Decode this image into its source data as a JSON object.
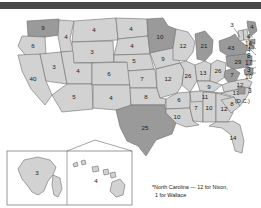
{
  "figure": {
    "footnote": "*North Carolina — 12 for Nixon, 1 for Wallace",
    "dc_label": "(D.C.)",
    "dc_votes": "3",
    "colors": {
      "light_state": "#d2d2d2",
      "dark_state": "#9a9a9a",
      "border": "#6d6d6d",
      "topbar": "#4a4a4a",
      "text": "#1a1a1a"
    }
  },
  "chart_data": {
    "type": "map",
    "units": "electoral votes",
    "legend": {
      "light": "light gray state",
      "dark": "dark gray state"
    },
    "annotations": [
      "*North Carolina — 12 for Nixon, 1 for Wallace",
      "(D.C.)"
    ],
    "states": [
      {
        "code": "WA",
        "label": "9",
        "shade": "dark"
      },
      {
        "code": "OR",
        "label": "6",
        "shade": "light"
      },
      {
        "code": "CA",
        "label": "40",
        "shade": "light"
      },
      {
        "code": "NV",
        "label": "3",
        "shade": "light"
      },
      {
        "code": "ID",
        "label": "4",
        "shade": "light"
      },
      {
        "code": "MT",
        "label": "4",
        "shade": "light"
      },
      {
        "code": "WY",
        "label": "3",
        "shade": "light"
      },
      {
        "code": "UT",
        "label": "4",
        "shade": "light"
      },
      {
        "code": "AZ",
        "label": "5",
        "shade": "light"
      },
      {
        "code": "CO",
        "label": "6",
        "shade": "light"
      },
      {
        "code": "NM",
        "label": "4",
        "shade": "light"
      },
      {
        "code": "ND",
        "label": "4",
        "shade": "light"
      },
      {
        "code": "SD",
        "label": "4",
        "shade": "light"
      },
      {
        "code": "NE",
        "label": "5",
        "shade": "light"
      },
      {
        "code": "KS",
        "label": "7",
        "shade": "light"
      },
      {
        "code": "OK",
        "label": "8",
        "shade": "light"
      },
      {
        "code": "TX",
        "label": "25",
        "shade": "dark"
      },
      {
        "code": "MN",
        "label": "10",
        "shade": "dark"
      },
      {
        "code": "IA",
        "label": "9",
        "shade": "light"
      },
      {
        "code": "MO",
        "label": "12",
        "shade": "light"
      },
      {
        "code": "AR",
        "label": "6",
        "shade": "light"
      },
      {
        "code": "LA",
        "label": "10",
        "shade": "light"
      },
      {
        "code": "WI",
        "label": "12",
        "shade": "light"
      },
      {
        "code": "IL",
        "label": "26",
        "shade": "light"
      },
      {
        "code": "MS",
        "label": "7",
        "shade": "light"
      },
      {
        "code": "MI",
        "label": "21",
        "shade": "dark"
      },
      {
        "code": "IN",
        "label": "13",
        "shade": "light"
      },
      {
        "code": "KY",
        "label": "9",
        "shade": "light"
      },
      {
        "code": "TN",
        "label": "11",
        "shade": "light"
      },
      {
        "code": "AL",
        "label": "10",
        "shade": "light"
      },
      {
        "code": "OH",
        "label": "26",
        "shade": "light"
      },
      {
        "code": "GA",
        "label": "12",
        "shade": "light"
      },
      {
        "code": "FL",
        "label": "14",
        "shade": "light"
      },
      {
        "code": "SC",
        "label": "8",
        "shade": "light"
      },
      {
        "code": "NC",
        "label": "13*",
        "shade": "light"
      },
      {
        "code": "VA",
        "label": "12",
        "shade": "light"
      },
      {
        "code": "WV",
        "label": "7",
        "shade": "dark"
      },
      {
        "code": "PA",
        "label": "29",
        "shade": "dark"
      },
      {
        "code": "NY",
        "label": "43",
        "shade": "dark"
      },
      {
        "code": "VT",
        "label": "3",
        "shade": "light"
      },
      {
        "code": "ME",
        "label": "4",
        "shade": "dark"
      },
      {
        "code": "AK",
        "label": "3",
        "shade": "light"
      },
      {
        "code": "HI",
        "label": "4",
        "shade": "light"
      }
    ],
    "leader_labels": [
      {
        "code": "NH",
        "label": "4"
      },
      {
        "code": "MA",
        "label": "14"
      },
      {
        "code": "RI",
        "label": "4"
      },
      {
        "code": "CT",
        "label": "8"
      },
      {
        "code": "NJ",
        "label": "17"
      },
      {
        "code": "DE",
        "label": "3"
      },
      {
        "code": "MD",
        "label": "10"
      },
      {
        "code": "DC",
        "label": "3"
      }
    ]
  }
}
